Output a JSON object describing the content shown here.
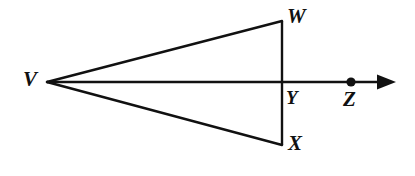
{
  "figure": {
    "kind": "geometry-diagram",
    "background_color": "#ffffff",
    "stroke_color": "#111111",
    "stroke_width": 2.4,
    "width": 415,
    "height": 176,
    "points": {
      "V": {
        "label": "V",
        "x": 47,
        "y": 82,
        "marked": false
      },
      "W": {
        "label": "W",
        "x": 282,
        "y": 21,
        "marked": false
      },
      "X": {
        "label": "X",
        "x": 282,
        "y": 145,
        "marked": false
      },
      "Y": {
        "label": "Y",
        "x": 282,
        "y": 82,
        "marked": false
      },
      "Z": {
        "label": "Z",
        "x": 351,
        "y": 82,
        "marked": true,
        "dot_radius": 4.6
      }
    },
    "segments": [
      {
        "name": "segment-VW",
        "from": "V",
        "to": "W"
      },
      {
        "name": "segment-VX",
        "from": "V",
        "to": "X"
      },
      {
        "name": "segment-WX",
        "from": "W",
        "to": "X"
      }
    ],
    "ray": {
      "name": "ray-VZ",
      "from": "V",
      "through": [
        "Y",
        "Z"
      ],
      "arrow_tip_x": 396,
      "arrow_tip_y": 82,
      "arrowhead": "solid-triangle"
    },
    "labels": {
      "V": "V",
      "W": "W",
      "X": "X",
      "Y": "Y",
      "Z": "Z"
    }
  }
}
